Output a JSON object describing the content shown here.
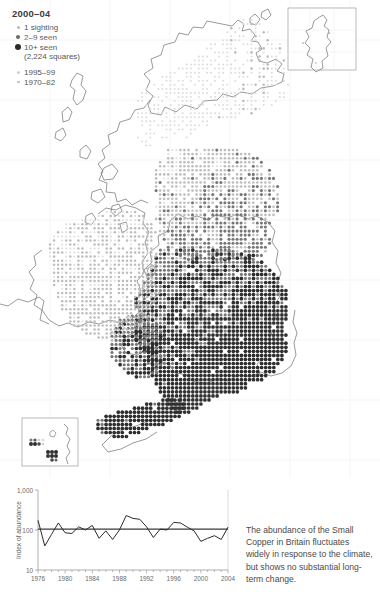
{
  "legend": {
    "title": "2000–04",
    "items": [
      {
        "marker": "small-open-dot",
        "label": "1 sighting"
      },
      {
        "marker": "medium-gray-dot",
        "label": "2–9 seen"
      },
      {
        "marker": "large-dark-dot",
        "label": "10+ seen"
      }
    ],
    "squares_note": "(2,224 squares)",
    "historic": [
      {
        "marker": "pale-dot",
        "label": "1995–99"
      },
      {
        "marker": "pale-dash",
        "label": "1970–82"
      }
    ]
  },
  "map": {
    "name": "britain-ireland-distribution-map",
    "insets": [
      {
        "name": "shetland-inset"
      },
      {
        "name": "channel-islands-inset"
      }
    ],
    "colors": {
      "coastline": "#6e6e6e",
      "gridline": "#ececec",
      "dot_dark": "#2f2f2f",
      "dot_mid": "#777777",
      "dot_light": "#bdbdbd",
      "dot_pale": "#dcdcdc"
    }
  },
  "caption": {
    "text": "The abundance of the Small Copper in Britain fluctuates widely in response to the climate, but shows no substantial long-term change."
  },
  "chart_data": {
    "type": "line",
    "title": "",
    "xlabel": "",
    "ylabel": "Index of abundance",
    "ylim": [
      10,
      1000
    ],
    "yscale": "log",
    "ytick_labels": [
      "1,000",
      "100",
      "10"
    ],
    "yticks": [
      1000,
      100,
      10
    ],
    "xlim": [
      1976,
      2004
    ],
    "xtick_labels": [
      "1976",
      "1980",
      "1984",
      "1988",
      "1992",
      "1996",
      "2000",
      "2004"
    ],
    "xticks": [
      1976,
      1980,
      1984,
      1988,
      1992,
      1996,
      2000,
      2004
    ],
    "grid": false,
    "legend": "none",
    "series": [
      {
        "name": "Index of abundance",
        "x": [
          1976,
          1977,
          1978,
          1979,
          1980,
          1981,
          1982,
          1983,
          1984,
          1985,
          1986,
          1987,
          1988,
          1989,
          1990,
          1991,
          1992,
          1993,
          1994,
          1995,
          1996,
          1997,
          1998,
          1999,
          2000,
          2001,
          2002,
          2003,
          2004
        ],
        "values": [
          175,
          40,
          78,
          150,
          85,
          82,
          120,
          100,
          130,
          62,
          95,
          58,
          100,
          230,
          195,
          185,
          120,
          65,
          105,
          100,
          155,
          150,
          118,
          95,
          52,
          62,
          72,
          58,
          118
        ]
      },
      {
        "name": "baseline",
        "x": [
          1976,
          2004
        ],
        "values": [
          105,
          105
        ]
      }
    ]
  }
}
